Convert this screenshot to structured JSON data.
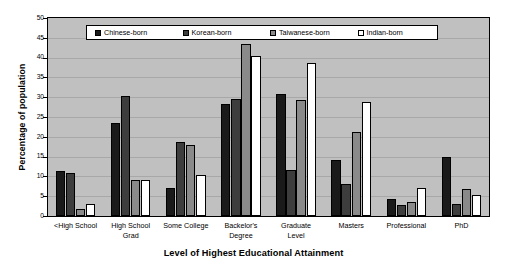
{
  "chart_data": {
    "type": "bar",
    "title": "",
    "xlabel": "Level of Highest Educational Attainment",
    "ylabel": "Percentage of population",
    "ylim": [
      0,
      50
    ],
    "ytick_step": 5,
    "yticks": [
      0,
      5,
      10,
      15,
      20,
      25,
      30,
      35,
      40,
      45,
      50
    ],
    "ytick_labels": [
      "0",
      "5",
      "10",
      "15",
      "20",
      "25",
      "30",
      "35",
      "40",
      "45",
      "50"
    ],
    "grid": true,
    "grid_axis": "y",
    "legend_position": "top-center",
    "plot_background": "#c0c0c0",
    "categories": [
      "<High School",
      "High School Grad",
      "Some College",
      "Bachelor's Degree",
      "Graduate Level",
      "Masters",
      "Professional",
      "PhD"
    ],
    "category_lines": [
      [
        "<High School"
      ],
      [
        "High School",
        "Grad"
      ],
      [
        "Some College"
      ],
      [
        "Backelor's",
        "Degree"
      ],
      [
        "Graduate",
        "Level"
      ],
      [
        "Masters"
      ],
      [
        "Professional"
      ],
      [
        "PhD"
      ]
    ],
    "series": [
      {
        "name": "Chinese-born",
        "color": "#1a1a1a",
        "values": [
          11.3,
          23.4,
          7.1,
          28.3,
          30.8,
          14.2,
          4.2,
          14.8
        ]
      },
      {
        "name": "Korean-born",
        "color": "#3d3d3d",
        "values": [
          10.9,
          30.4,
          18.7,
          29.5,
          11.7,
          8.2,
          2.8,
          3.0
        ]
      },
      {
        "name": "Taiwanese-born",
        "color": "#8a8a8a",
        "values": [
          1.8,
          9.1,
          17.9,
          43.4,
          29.2,
          21.2,
          3.5,
          6.8
        ]
      },
      {
        "name": "Indian-born",
        "color": "#ffffff",
        "values": [
          3.1,
          9.1,
          10.3,
          40.5,
          38.6,
          28.8,
          7.0,
          5.2
        ]
      }
    ]
  }
}
